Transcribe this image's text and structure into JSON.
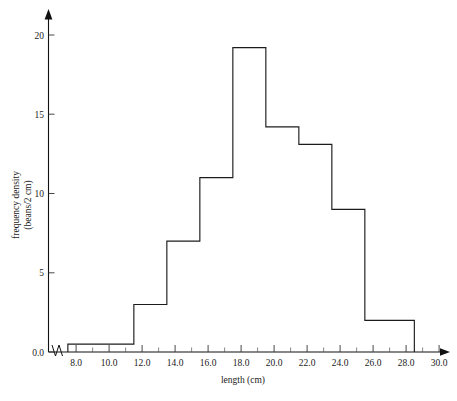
{
  "chart_data": {
    "type": "bar",
    "title": "",
    "subtitle": "",
    "xlabel": "length (cm)",
    "ylabel": "frequency density",
    "ylabel_line2": "(beans/2 cm)",
    "xlim": [
      7.0,
      30.6
    ],
    "ylim": [
      0,
      21.3
    ],
    "grid": false,
    "legend": null,
    "x_tick_labels": [
      "8.0",
      "10.0",
      "12.0",
      "14.0",
      "16.0",
      "18.0",
      "20.0",
      "22.0",
      "24.0",
      "26.0",
      "28.0",
      "30.0"
    ],
    "x_tick_values": [
      8.0,
      10.0,
      12.0,
      14.0,
      16.0,
      18.0,
      20.0,
      22.0,
      24.0,
      26.0,
      28.0,
      30.0
    ],
    "x_minor_tick_values": [
      9.0,
      11.0,
      13.0,
      15.0,
      17.0,
      19.0,
      21.0,
      23.0,
      25.0,
      27.0,
      29.0
    ],
    "y_tick_labels": [
      "0.0",
      "5",
      "10",
      "15",
      "20"
    ],
    "y_tick_values": [
      0,
      5,
      10,
      15,
      20
    ],
    "axis_break": true,
    "bin_edges": [
      7.5,
      11.5,
      13.5,
      15.5,
      17.5,
      19.5,
      21.5,
      23.5,
      25.5,
      28.5
    ],
    "bars": [
      {
        "x_start": 7.5,
        "x_end": 11.5,
        "height": 0.5
      },
      {
        "x_start": 11.5,
        "x_end": 13.5,
        "height": 3.0
      },
      {
        "x_start": 13.5,
        "x_end": 15.5,
        "height": 7.0
      },
      {
        "x_start": 15.5,
        "x_end": 17.5,
        "height": 11.0
      },
      {
        "x_start": 17.5,
        "x_end": 19.5,
        "height": 19.2
      },
      {
        "x_start": 19.5,
        "x_end": 21.5,
        "height": 14.2
      },
      {
        "x_start": 21.5,
        "x_end": 23.5,
        "height": 13.1
      },
      {
        "x_start": 23.5,
        "x_end": 25.5,
        "height": 9.0
      },
      {
        "x_start": 25.5,
        "x_end": 28.5,
        "height": 2.0
      }
    ],
    "categories": [
      "7.5-11.5",
      "11.5-13.5",
      "13.5-15.5",
      "15.5-17.5",
      "17.5-19.5",
      "19.5-21.5",
      "21.5-23.5",
      "23.5-25.5",
      "25.5-28.5"
    ],
    "values": [
      0.5,
      3.0,
      7.0,
      11.0,
      19.2,
      14.2,
      13.1,
      9.0,
      2.0
    ],
    "colors": {
      "bar_stroke": "#1c1c1c",
      "bar_fill": "none",
      "axis": "#111111",
      "text": "#1a1a1a",
      "background": "#ffffff"
    }
  }
}
